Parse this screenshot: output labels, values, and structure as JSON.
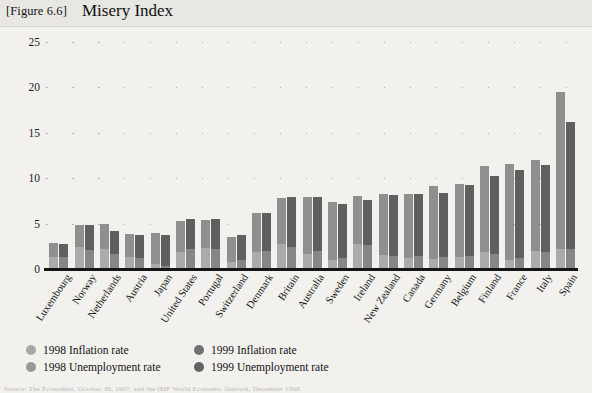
{
  "header": {
    "figure_tag": "[Figure 6.6]",
    "title": "Misery Index"
  },
  "footer": {
    "source": "Source: The Economist, October 30, 1997, and the IMF World Economic Outlook, December 1998."
  },
  "legend": {
    "items": [
      {
        "label": "1998 Inflation rate",
        "color": "#a8a8a8",
        "name": "legend-1998-inflation"
      },
      {
        "label": "1998 Unemployment rate",
        "color": "#989898",
        "name": "legend-1998-unemployment"
      },
      {
        "label": "1999 Inflation rate",
        "color": "#717171",
        "name": "legend-1999-inflation"
      },
      {
        "label": "1999 Unemployment rate",
        "color": "#636363",
        "name": "legend-1999-unemployment"
      }
    ]
  },
  "colors": {
    "infl_1998": "#ababab",
    "unemp_1998": "#8f8f8f",
    "infl_1999": "#868686",
    "unemp_1999": "#5f5f5f",
    "axis": "#151515",
    "background": "#f2f1ee",
    "header_band": "#e8e7e3"
  },
  "chart_data": {
    "type": "bar",
    "title": "Misery Index",
    "subtype": "grouped-stacked",
    "xlabel": "",
    "ylabel": "",
    "ylim": [
      0,
      25
    ],
    "yticks": [
      0,
      5,
      10,
      15,
      20,
      25
    ],
    "grid": "dotted-horizontal",
    "legend_position": "bottom-left",
    "categories": [
      "Luxembourg",
      "Norway",
      "Netherlands",
      "Austria",
      "Japan",
      "United States",
      "Portugal",
      "Switzerland",
      "Denmark",
      "Britain",
      "Australia",
      "Sweden",
      "Ireland",
      "New Zealand",
      "Canada",
      "Germany",
      "Belgium",
      "Finland",
      "France",
      "Italy",
      "Spain"
    ],
    "series": [
      {
        "name": "1998 Inflation rate",
        "group": "1998",
        "stack_part": "inflation",
        "values": [
          1.3,
          2.4,
          2.2,
          1.3,
          0.6,
          1.9,
          2.3,
          0.8,
          1.9,
          2.7,
          1.6,
          1.0,
          2.7,
          1.5,
          1.2,
          1.1,
          1.3,
          1.9,
          1.0,
          2.0,
          2.2
        ]
      },
      {
        "name": "1998 Unemployment rate",
        "group": "1998",
        "stack_part": "unemployment",
        "values": [
          1.6,
          2.4,
          2.8,
          2.6,
          3.4,
          3.4,
          3.1,
          2.7,
          4.3,
          5.1,
          6.3,
          6.4,
          5.3,
          6.8,
          7.1,
          8.0,
          8.1,
          9.5,
          10.6,
          10.0,
          17.3
        ]
      },
      {
        "name": "1999 Inflation rate",
        "group": "1999",
        "stack_part": "inflation",
        "values": [
          1.3,
          2.1,
          1.6,
          1.2,
          0.3,
          2.2,
          2.2,
          1.0,
          2.0,
          2.4,
          2.0,
          1.2,
          2.6,
          1.4,
          1.4,
          1.3,
          1.4,
          1.6,
          1.2,
          1.9,
          2.2
        ]
      },
      {
        "name": "1999 Unemployment rate",
        "group": "1999",
        "stack_part": "unemployment",
        "values": [
          1.5,
          2.7,
          2.6,
          2.5,
          3.5,
          3.3,
          3.3,
          2.7,
          4.2,
          5.5,
          5.9,
          6.0,
          5.0,
          6.7,
          6.9,
          7.1,
          7.9,
          8.7,
          9.7,
          9.6,
          14.0
        ]
      }
    ],
    "totals": {
      "1998": [
        2.9,
        4.8,
        5.0,
        3.9,
        4.0,
        5.3,
        5.4,
        3.5,
        6.2,
        7.8,
        7.9,
        7.4,
        8.0,
        8.3,
        8.3,
        9.1,
        9.4,
        11.4,
        11.6,
        12.0,
        19.5
      ],
      "1999": [
        2.8,
        4.8,
        4.2,
        3.7,
        3.8,
        5.5,
        5.5,
        3.7,
        6.2,
        7.9,
        7.9,
        7.2,
        7.6,
        8.1,
        8.3,
        8.4,
        9.3,
        10.3,
        10.9,
        11.5,
        16.2
      ]
    }
  }
}
